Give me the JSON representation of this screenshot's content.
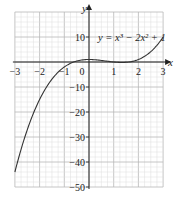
{
  "chart_data": {
    "type": "line",
    "title": "",
    "equation_label": "y = x³ − 2x² + 1",
    "xlabel": "x",
    "ylabel": "y",
    "xlim": [
      -3,
      3
    ],
    "ylim": [
      -50,
      20
    ],
    "x_ticks": [
      -3,
      -2,
      -1,
      0,
      1,
      2,
      3
    ],
    "x_tick_labels": [
      "−3",
      "−2",
      "−1",
      "0",
      "1",
      "2",
      "3"
    ],
    "y_ticks": [
      10,
      -10,
      -20,
      -30,
      -40,
      -50
    ],
    "y_tick_labels": [
      "10",
      "−10",
      "−20",
      "−30",
      "−40",
      "−50"
    ],
    "grid": true,
    "minor_grid": true,
    "series": [
      {
        "name": "y = x³ − 2x² + 1",
        "x": [
          -3,
          -2.5,
          -2,
          -1.5,
          -1,
          -0.5,
          0,
          0.5,
          1,
          1.5,
          2,
          2.5,
          3
        ],
        "values": [
          -44,
          -27.1,
          -15,
          -6.9,
          -2,
          0.375,
          1,
          0.625,
          0,
          -0.125,
          1,
          4.125,
          10
        ]
      }
    ],
    "colors": {
      "grid_major": "#b8b8b8",
      "grid_minor": "#dcdcdc",
      "axis": "#222222",
      "curve": "#333333"
    }
  }
}
